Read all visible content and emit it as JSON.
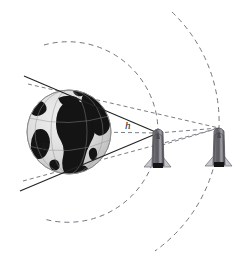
{
  "diagram": {
    "labels": {
      "radius": "R",
      "altitude": "h"
    },
    "colors": {
      "background": "#ffffff",
      "line": "#2b2b2b",
      "dashed": "#6e6e7a",
      "earth_ocean": "#d9d9d9",
      "earth_land": "#161616",
      "earth_edge": "#8f8f8f",
      "shuttle_body": "#59595e",
      "shuttle_wing": "#bcbcc2",
      "shuttle_dark": "#1a1a1a"
    },
    "earth": {
      "name": "earth-globe",
      "cx": 69,
      "cy": 132,
      "r": 42
    },
    "objects": [
      {
        "name": "spacecraft-near",
        "x": 158,
        "y": 148,
        "scale": 1.0
      },
      {
        "name": "spacecraft-far",
        "x": 219,
        "y": 147,
        "scale": 1.0
      }
    ],
    "orbits": [
      {
        "name": "inner-orbit-arc",
        "cx": 69,
        "cy": 132,
        "r": 90
      },
      {
        "name": "outer-orbit-arc",
        "cx": 69,
        "cy": 132,
        "r": 152
      }
    ],
    "sight_lines": [
      {
        "name": "tangent-line-upper",
        "x1": 24,
        "y1": 76,
        "x2": 158,
        "y2": 133
      },
      {
        "name": "tangent-line-lower",
        "x1": 20,
        "y1": 191,
        "x2": 158,
        "y2": 133
      }
    ],
    "dashed_lines": [
      {
        "name": "altitude-line-h",
        "x1": 92,
        "y1": 131,
        "x2": 157,
        "y2": 133
      },
      {
        "name": "radius-line-upper",
        "x1": 69,
        "y1": 132,
        "x2": 81,
        "y2": 93
      },
      {
        "name": "radius-line-lower",
        "x1": 69,
        "y1": 132,
        "x2": 78,
        "y2": 174
      },
      {
        "name": "radius-line-R",
        "x1": 69,
        "y1": 132,
        "x2": 44,
        "y2": 166
      },
      {
        "name": "radius-line-R2",
        "x1": 69,
        "y1": 132,
        "x2": 55,
        "y2": 169
      },
      {
        "name": "horizon-chord-upper",
        "x1": 28,
        "y1": 83,
        "x2": 219,
        "y2": 128
      },
      {
        "name": "horizon-chord-lower",
        "x1": 23,
        "y1": 182,
        "x2": 219,
        "y2": 128
      },
      {
        "name": "link-near-to-far",
        "x1": 158,
        "y1": 133,
        "x2": 219,
        "y2": 128
      },
      {
        "name": "link-far-down",
        "x1": 219,
        "y1": 128,
        "x2": 158,
        "y2": 147
      }
    ]
  }
}
